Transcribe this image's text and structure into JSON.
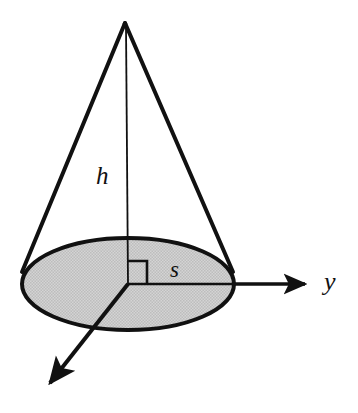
{
  "figure": {
    "labels": {
      "height": "h",
      "radius": "s",
      "axis_y": "y"
    },
    "colors": {
      "stroke": "#111111",
      "base_fill": "#c8c8c8",
      "background": "#ffffff"
    },
    "geometry": {
      "apex": [
        125,
        23
      ],
      "base_center": [
        128,
        284
      ],
      "base_rx": 106,
      "base_ry": 46,
      "left_slant_end": [
        22,
        272
      ],
      "right_slant_end": [
        233,
        272
      ],
      "y_axis_tip": [
        312,
        284
      ],
      "x_axis_tip": [
        44,
        390
      ],
      "right_angle_marker": [
        128,
        261,
        147,
        284
      ]
    },
    "parts": {
      "apex_point": "cone-apex",
      "base_ellipse": "cone-base-ellipse",
      "left_slant": "cone-left-slant",
      "right_slant": "cone-right-slant",
      "height_line": "cone-height-line",
      "radius_line": "cone-radius-line",
      "y_axis": "axis-y",
      "x_axis": "axis-x",
      "right_angle": "right-angle-marker"
    }
  }
}
